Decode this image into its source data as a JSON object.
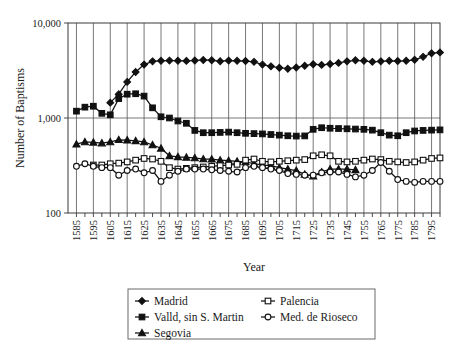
{
  "chart_data": {
    "type": "line",
    "title": "",
    "xlabel": "Year",
    "ylabel": "Number of Baptisms",
    "yscale": "log",
    "ylim": [
      100,
      10000
    ],
    "ytick_labels": [
      "10,000",
      "1,000",
      "100"
    ],
    "ytick_values": [
      10000,
      1000,
      100
    ],
    "xlim": [
      1580,
      1800
    ],
    "grid": true,
    "legend_position": "below-plot",
    "xtick_labels": [
      "1585",
      "1595",
      "1605",
      "1615",
      "1625",
      "1635",
      "1645",
      "1655",
      "1665",
      "1675",
      "1685",
      "1695",
      "1705",
      "1715",
      "1725",
      "1735",
      "1745",
      "1755",
      "1765",
      "1775",
      "1785",
      "1795"
    ],
    "x": [
      1585,
      1590,
      1595,
      1600,
      1605,
      1610,
      1615,
      1620,
      1625,
      1630,
      1635,
      1640,
      1645,
      1650,
      1655,
      1660,
      1665,
      1670,
      1675,
      1680,
      1685,
      1690,
      1695,
      1700,
      1705,
      1710,
      1715,
      1720,
      1725,
      1730,
      1735,
      1740,
      1745,
      1750,
      1755,
      1760,
      1765,
      1770,
      1775,
      1780,
      1785,
      1790,
      1795,
      1800
    ],
    "series": [
      {
        "name": "Madrid",
        "marker": "filled-diamond",
        "x": [
          1605,
          1610,
          1615,
          1620,
          1625,
          1630,
          1635,
          1640,
          1645,
          1650,
          1655,
          1660,
          1665,
          1670,
          1675,
          1680,
          1685,
          1690,
          1695,
          1700,
          1705,
          1710,
          1715,
          1720,
          1725,
          1730,
          1735,
          1740,
          1745,
          1750,
          1755,
          1760,
          1765,
          1770,
          1775,
          1780,
          1785,
          1790,
          1795,
          1800
        ],
        "values": [
          1450,
          1780,
          2400,
          3050,
          3650,
          3950,
          4000,
          4020,
          4010,
          3990,
          4030,
          4080,
          4050,
          3960,
          4020,
          4000,
          3980,
          3900,
          3650,
          3500,
          3380,
          3300,
          3400,
          3550,
          3680,
          3620,
          3700,
          3800,
          3950,
          4050,
          4000,
          3900,
          3950,
          4000,
          3980,
          4000,
          4100,
          4400,
          4800,
          4900
        ]
      },
      {
        "name": "Valld, sin S. Martin",
        "marker": "filled-square",
        "x": [
          1585,
          1590,
          1595,
          1600,
          1605,
          1610,
          1615,
          1620,
          1625,
          1630,
          1635,
          1640,
          1645,
          1650,
          1655,
          1660,
          1665,
          1670,
          1675,
          1680,
          1685,
          1690,
          1695,
          1700,
          1705,
          1710,
          1715,
          1720,
          1725,
          1730,
          1735,
          1740,
          1745,
          1750,
          1755,
          1760,
          1765,
          1770,
          1775,
          1780,
          1785,
          1790,
          1795,
          1800
        ],
        "values": [
          1180,
          1300,
          1330,
          1120,
          1080,
          1600,
          1780,
          1800,
          1700,
          1280,
          1030,
          1000,
          930,
          880,
          740,
          700,
          700,
          705,
          710,
          700,
          690,
          685,
          680,
          670,
          660,
          650,
          645,
          648,
          760,
          790,
          780,
          775,
          770,
          765,
          760,
          745,
          700,
          660,
          650,
          700,
          730,
          740,
          745,
          750
        ]
      },
      {
        "name": "Segovia",
        "marker": "filled-triangle",
        "x": [
          1585,
          1590,
          1595,
          1600,
          1605,
          1610,
          1615,
          1620,
          1625,
          1630,
          1635,
          1640,
          1645,
          1650,
          1655,
          1660,
          1665,
          1670,
          1675,
          1680,
          1685,
          1690,
          1695,
          1700,
          1705,
          1710,
          1715,
          1720,
          1725,
          1730,
          1735,
          1740,
          1745,
          1750
        ],
        "values": [
          530,
          560,
          555,
          545,
          560,
          590,
          585,
          575,
          560,
          520,
          480,
          400,
          390,
          385,
          380,
          370,
          368,
          360,
          355,
          350,
          345,
          330,
          320,
          315,
          300,
          290,
          280,
          255,
          245,
          270,
          290,
          290,
          290,
          285
        ]
      },
      {
        "name": "Palencia",
        "marker": "open-square",
        "x": [
          1595,
          1600,
          1605,
          1610,
          1615,
          1620,
          1625,
          1630,
          1635,
          1640,
          1645,
          1650,
          1655,
          1660,
          1665,
          1670,
          1675,
          1680,
          1685,
          1690,
          1695,
          1700,
          1705,
          1710,
          1715,
          1720,
          1725,
          1730,
          1735,
          1740,
          1745,
          1750,
          1755,
          1760,
          1765,
          1770,
          1775,
          1780,
          1785,
          1790,
          1795,
          1800
        ],
        "values": [
          320,
          320,
          330,
          335,
          345,
          360,
          375,
          370,
          350,
          300,
          290,
          295,
          300,
          305,
          310,
          315,
          320,
          325,
          360,
          370,
          350,
          345,
          350,
          355,
          360,
          365,
          400,
          410,
          400,
          350,
          345,
          350,
          360,
          370,
          365,
          350,
          345,
          340,
          345,
          360,
          375,
          380
        ]
      },
      {
        "name": "Med. de Rioseco",
        "marker": "open-circle",
        "x": [
          1585,
          1590,
          1595,
          1600,
          1605,
          1610,
          1615,
          1620,
          1625,
          1630,
          1635,
          1640,
          1645,
          1650,
          1655,
          1660,
          1665,
          1670,
          1675,
          1680,
          1685,
          1690,
          1695,
          1700,
          1705,
          1710,
          1715,
          1720,
          1725,
          1730,
          1735,
          1740,
          1745,
          1750,
          1755,
          1760,
          1765,
          1770,
          1775,
          1780,
          1785,
          1790,
          1795,
          1800
        ],
        "values": [
          310,
          330,
          310,
          300,
          300,
          250,
          280,
          290,
          265,
          280,
          215,
          250,
          275,
          290,
          290,
          290,
          285,
          280,
          275,
          270,
          300,
          310,
          300,
          290,
          280,
          260,
          255,
          250,
          250,
          265,
          270,
          270,
          255,
          240,
          250,
          280,
          340,
          275,
          225,
          215,
          210,
          215,
          215,
          215
        ]
      }
    ]
  },
  "legend": {
    "entries": [
      {
        "label": "Madrid",
        "marker": "filled-diamond"
      },
      {
        "label": "Palencia",
        "marker": "open-square"
      },
      {
        "label": "Valld, sin S. Martin",
        "marker": "filled-square"
      },
      {
        "label": "Med. de Rioseco",
        "marker": "open-circle"
      },
      {
        "label": "Segovia",
        "marker": "filled-triangle"
      }
    ]
  }
}
